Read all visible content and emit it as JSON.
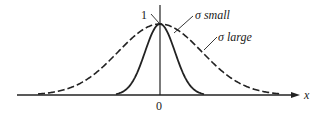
{
  "diagram": {
    "title": "",
    "axis": {
      "x_label": "x",
      "origin_label": "0",
      "peak_label": "1"
    },
    "curves": [
      {
        "name": "sigma-small",
        "label": "σ small",
        "style": "solid",
        "sigma_relative": "small"
      },
      {
        "name": "sigma-large",
        "label": "σ large",
        "style": "dashed",
        "sigma_relative": "large"
      }
    ],
    "colors": {
      "ink": "#222222",
      "background": "#ffffff"
    }
  }
}
